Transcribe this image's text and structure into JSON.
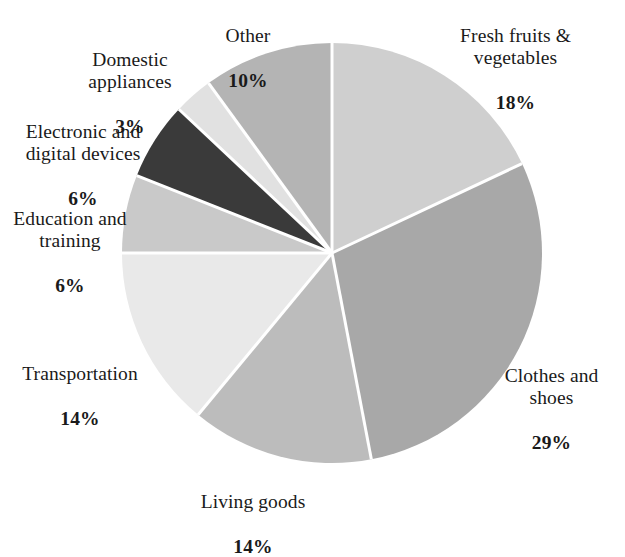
{
  "chart_data": {
    "type": "pie",
    "title": "",
    "subtitle": "",
    "xlabel": "",
    "ylabel": "",
    "legend_position": "none",
    "grid": false,
    "units": "percent",
    "start_angle_deg": 0,
    "direction": "clockwise",
    "categories": [
      "Fresh fruits & vegetables",
      "Clothes and shoes",
      "Living goods",
      "Transportation",
      "Education and training",
      "Electronic and digital devices",
      "Domestic appliances",
      "Other"
    ],
    "values": [
      18,
      29,
      14,
      14,
      6,
      6,
      3,
      10
    ],
    "value_labels": [
      "18%",
      "29%",
      "14%",
      "14%",
      "6%",
      "6%",
      "3%",
      "10%"
    ],
    "slice_colors": [
      "#cfcfcf",
      "#a8a8a8",
      "#bcbcbc",
      "#e9e9e9",
      "#c9c9c9",
      "#3a3a3a",
      "#e1e1e1",
      "#b4b4b4"
    ],
    "separator_color": "#ffffff",
    "background_color": "#ffffff",
    "geometry": {
      "cx": 332,
      "cy": 253,
      "r": 210
    }
  },
  "labels": {
    "fresh": {
      "name": "Fresh fruits &\nvegetables",
      "value": "18%"
    },
    "clothes": {
      "name": "Clothes and\nshoes",
      "value": "29%"
    },
    "living": {
      "name": "Living goods",
      "value": "14%"
    },
    "transportation": {
      "name": "Transportation",
      "value": "14%"
    },
    "education": {
      "name": "Education and\ntraining",
      "value": "6%"
    },
    "electronic": {
      "name": "Electronic and\ndigital devices",
      "value": "6%"
    },
    "domestic": {
      "name": "Domestic\nappliances",
      "value": "3%"
    },
    "other": {
      "name": "Other",
      "value": "10%"
    }
  }
}
